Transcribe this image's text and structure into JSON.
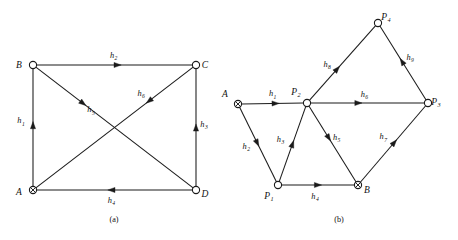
{
  "figure": {
    "background_color": "#ffffff",
    "stroke_color": "#1a1a1a",
    "text_color": "#111111",
    "panels": [
      {
        "id": "panel-a",
        "caption": "(a)",
        "caption_x": 114,
        "caption_y": 222,
        "nodes": [
          {
            "id": "A",
            "label": "A",
            "subscript": "",
            "x": 33,
            "y": 190,
            "type": "cross-circle",
            "label_dx": -14,
            "label_dy": 5
          },
          {
            "id": "B",
            "label": "B",
            "subscript": "",
            "x": 33,
            "y": 65,
            "type": "open",
            "label_dx": -14,
            "label_dy": 3
          },
          {
            "id": "C",
            "label": "C",
            "subscript": "",
            "x": 196,
            "y": 65,
            "type": "open",
            "label_dx": 9,
            "label_dy": 3
          },
          {
            "id": "D",
            "label": "D",
            "subscript": "",
            "x": 196,
            "y": 190,
            "type": "open",
            "label_dx": 9,
            "label_dy": 7
          }
        ],
        "edges": [
          {
            "id": "a-h1",
            "label": "h",
            "subscript": "1",
            "from": "A",
            "to": "B",
            "arrow_t": 0.52,
            "label_dx": -12,
            "label_dy": -2
          },
          {
            "id": "a-h2",
            "label": "h",
            "subscript": "2",
            "from": "B",
            "to": "C",
            "arrow_t": 0.52,
            "label_dx": -4,
            "label_dy": -7
          },
          {
            "id": "a-h3",
            "label": "h",
            "subscript": "3",
            "from": "D",
            "to": "C",
            "arrow_t": 0.5,
            "label_dx": 8,
            "label_dy": -1
          },
          {
            "id": "a-h4",
            "label": "h",
            "subscript": "4",
            "from": "D",
            "to": "A",
            "arrow_t": 0.52,
            "label_dx": 0,
            "label_dy": 13
          },
          {
            "id": "a-h5",
            "label": "h",
            "subscript": "5",
            "from": "B",
            "to": "D",
            "arrow_t": 0.3,
            "label_dx": 8,
            "label_dy": 9
          },
          {
            "id": "a-h6",
            "label": "h",
            "subscript": "6",
            "from": "C",
            "to": "A",
            "arrow_t": 0.28,
            "label_dx": -8,
            "label_dy": -5
          }
        ]
      },
      {
        "id": "panel-b",
        "caption": "(b)",
        "caption_x": 339,
        "caption_y": 222,
        "nodes": [
          {
            "id": "A",
            "label": "A",
            "subscript": "",
            "x": 238,
            "y": 104,
            "type": "cross-circle",
            "label_dx": -13,
            "label_dy": -7
          },
          {
            "id": "P1",
            "label": "P",
            "subscript": "1",
            "x": 278,
            "y": 185,
            "type": "open",
            "label_dx": -9,
            "label_dy": 14
          },
          {
            "id": "P2",
            "label": "P",
            "subscript": "2",
            "x": 307,
            "y": 103,
            "type": "open",
            "label_dx": -11,
            "label_dy": -8
          },
          {
            "id": "B",
            "label": "B",
            "subscript": "",
            "x": 358,
            "y": 185,
            "type": "cross-circle",
            "label_dx": 9,
            "label_dy": 8
          },
          {
            "id": "P3",
            "label": "P",
            "subscript": "3",
            "x": 428,
            "y": 103,
            "type": "open",
            "label_dx": 8,
            "label_dy": 2
          },
          {
            "id": "P4",
            "label": "P",
            "subscript": "4",
            "x": 378,
            "y": 23,
            "type": "open",
            "label_dx": 8,
            "label_dy": -3
          }
        ],
        "edges": [
          {
            "id": "b-h1",
            "label": "h",
            "subscript": "1",
            "from": "A",
            "to": "P2",
            "arrow_t": 0.55,
            "label_dx": -3,
            "label_dy": -7
          },
          {
            "id": "b-h2",
            "label": "h",
            "subscript": "2",
            "from": "A",
            "to": "P1",
            "arrow_t": 0.48,
            "label_dx": -11,
            "label_dy": 6
          },
          {
            "id": "b-h3",
            "label": "h",
            "subscript": "3",
            "from": "P1",
            "to": "P2",
            "arrow_t": 0.5,
            "label_dx": -12,
            "label_dy": -2
          },
          {
            "id": "b-h4",
            "label": "h",
            "subscript": "4",
            "from": "P1",
            "to": "B",
            "arrow_t": 0.5,
            "label_dx": -3,
            "label_dy": 14
          },
          {
            "id": "b-h5",
            "label": "h",
            "subscript": "5",
            "from": "P2",
            "to": "B",
            "arrow_t": 0.42,
            "label_dx": 8,
            "label_dy": 2
          },
          {
            "id": "b-h6",
            "label": "h",
            "subscript": "6",
            "from": "P2",
            "to": "P3",
            "arrow_t": 0.42,
            "label_dx": 6,
            "label_dy": -6
          },
          {
            "id": "b-h7",
            "label": "h",
            "subscript": "7",
            "from": "B",
            "to": "P3",
            "arrow_t": 0.52,
            "label_dx": -11,
            "label_dy": -3
          },
          {
            "id": "b-h8",
            "label": "h",
            "subscript": "8",
            "from": "P2",
            "to": "P4",
            "arrow_t": 0.42,
            "label_dx": -10,
            "label_dy": -2
          },
          {
            "id": "b-h9",
            "label": "h",
            "subscript": "9",
            "from": "P3",
            "to": "P4",
            "arrow_t": 0.52,
            "label_dx": 8,
            "label_dy": -2
          }
        ]
      }
    ]
  }
}
